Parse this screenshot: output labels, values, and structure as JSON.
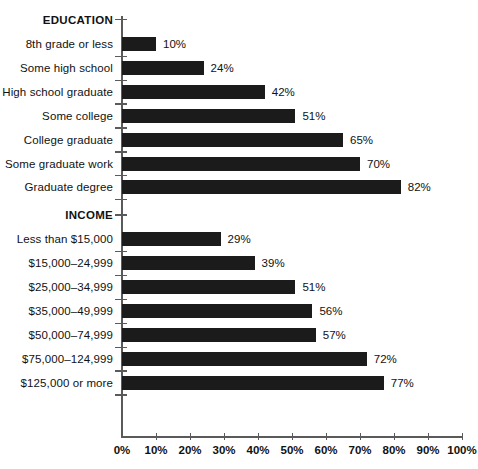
{
  "chart_data": {
    "type": "bar",
    "orientation": "horizontal",
    "title": "",
    "subtitle": "",
    "xlabel": "",
    "ylabel": "",
    "xlim": [
      0,
      100
    ],
    "xtick_labels": [
      "0%",
      "10%",
      "20%",
      "30%",
      "40%",
      "50%",
      "60%",
      "70%",
      "80%",
      "90%",
      "100%"
    ],
    "xtick_values": [
      0,
      10,
      20,
      30,
      40,
      50,
      60,
      70,
      80,
      90,
      100
    ],
    "grid": false,
    "legend": "none",
    "value_label_suffix": "%",
    "bar_color": "#1b1b1b",
    "axis_color": "#5a5a5a",
    "groups": [
      {
        "name": "EDUCATION",
        "categories": [
          "8th grade or less",
          "Some high school",
          "High school graduate",
          "Some college",
          "College graduate",
          "Some graduate work",
          "Graduate degree"
        ],
        "values": [
          10,
          24,
          42,
          51,
          65,
          70,
          82
        ],
        "value_labels": [
          "10%",
          "24%",
          "42%",
          "51%",
          "65%",
          "70%",
          "82%"
        ]
      },
      {
        "name": "INCOME",
        "categories": [
          "Less than $15,000",
          "$15,000–24,999",
          "$25,000–34,999",
          "$35,000–49,999",
          "$50,000–74,999",
          "$75,000–124,999",
          "$125,000 or more"
        ],
        "values": [
          29,
          39,
          51,
          56,
          57,
          72,
          77
        ],
        "value_labels": [
          "29%",
          "39%",
          "51%",
          "56%",
          "57%",
          "72%",
          "77%"
        ]
      }
    ]
  }
}
